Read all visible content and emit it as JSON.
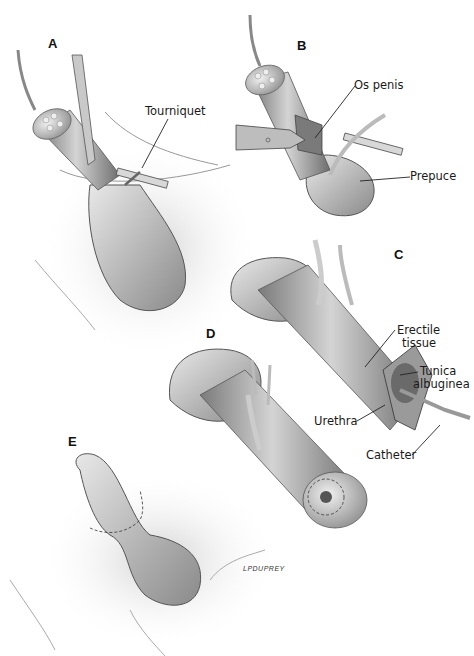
{
  "figure": {
    "panels": [
      {
        "id": "A",
        "label": "A"
      },
      {
        "id": "B",
        "label": "B"
      },
      {
        "id": "C",
        "label": "C"
      },
      {
        "id": "D",
        "label": "D"
      },
      {
        "id": "E",
        "label": "E"
      }
    ],
    "callouts": {
      "tourniquet": "Tourniquet",
      "os_penis": "Os penis",
      "prepuce": "Prepuce",
      "erectile_tissue_1": "Erectile",
      "erectile_tissue_2": "tissue",
      "tunica_albuginea_1": "Tunica",
      "tunica_albuginea_2": "albuginea",
      "urethra": "Urethra",
      "catheter": "Catheter"
    },
    "signature": "LPDUPREY"
  }
}
